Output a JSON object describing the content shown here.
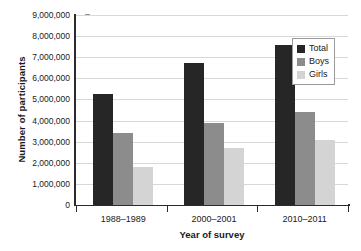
{
  "chart_data": {
    "type": "bar",
    "title": "",
    "xlabel": "Year of survey",
    "ylabel": "Number of participants",
    "categories": [
      "1988–1989",
      "2000–2001",
      "2010–2011"
    ],
    "series": [
      {
        "name": "Total",
        "color": "#262626",
        "values": [
          5250000,
          6720000,
          7580000
        ]
      },
      {
        "name": "Boys",
        "color": "#8c8c8c",
        "values": [
          3400000,
          3880000,
          4400000
        ]
      },
      {
        "name": "Girls",
        "color": "#d4d4d4",
        "values": [
          1800000,
          2700000,
          3060000
        ]
      }
    ],
    "ylim": [
      0,
      9000000
    ],
    "ytick_step": 1000000,
    "ytick_labels": [
      "9,000,000",
      "8,000,000",
      "7,000,000",
      "6,000,000",
      "5,000,000",
      "4,000,000",
      "3,000,000",
      "2,000,000",
      "1,000,000",
      "0"
    ],
    "grid": true,
    "legend_position": "top-right"
  },
  "legend": {
    "items": [
      {
        "label": "Total",
        "color": "#262626"
      },
      {
        "label": "Boys",
        "color": "#8c8c8c"
      },
      {
        "label": "Girls",
        "color": "#d4d4d4"
      }
    ]
  }
}
